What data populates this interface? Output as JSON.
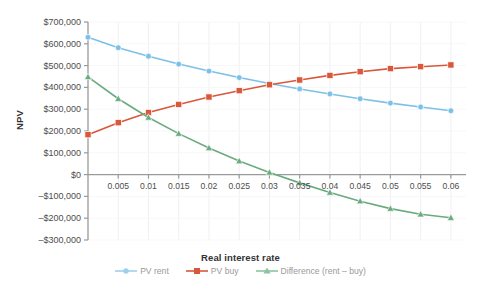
{
  "chart_data": {
    "type": "line",
    "title": "",
    "xlabel": "Real interest rate",
    "ylabel": "NPV",
    "x": [
      0,
      0.005,
      0.01,
      0.015,
      0.02,
      0.025,
      0.03,
      0.035,
      0.04,
      0.045,
      0.05,
      0.055,
      0.06
    ],
    "categories": [
      "0",
      "0.005",
      "0.01",
      "0.015",
      "0.02",
      "0.025",
      "0.03",
      "0.035",
      "0.04",
      "0.045",
      "0.05",
      "0.055",
      "0.06"
    ],
    "xtick_labels": [
      "0.005",
      "0.01",
      "0.015",
      "0.02",
      "0.025",
      "0.03",
      "0.035",
      "0.04",
      "0.045",
      "0.05",
      "0.055",
      "0.06"
    ],
    "ytick_labels": [
      "$700,000",
      "$600,000",
      "$500,000",
      "$400,000",
      "$300,000",
      "$200,000",
      "$100,000",
      "$0",
      "–$100,000",
      "–$200,000",
      "–$300,000"
    ],
    "ytick_values": [
      700000,
      600000,
      500000,
      400000,
      300000,
      200000,
      100000,
      0,
      -100000,
      -200000,
      -300000
    ],
    "ylim": [
      -300000,
      700000
    ],
    "xlim": [
      0,
      0.0625
    ],
    "grid": true,
    "legend_position": "bottom",
    "series": [
      {
        "name": "PV rent",
        "color": "#7cc0e8",
        "marker": "circle",
        "values": [
          630000,
          582000,
          543000,
          507000,
          475000,
          445000,
          418000,
          393000,
          370000,
          348000,
          328000,
          310000,
          293000
        ]
      },
      {
        "name": "PV buy",
        "color": "#d9573a",
        "marker": "square",
        "values": [
          183000,
          238000,
          285000,
          322000,
          356000,
          385000,
          412000,
          434000,
          455000,
          472000,
          486000,
          495000,
          503000
        ]
      },
      {
        "name": "Difference (rent – buy)",
        "color": "#69ab7f",
        "marker": "triangle",
        "values": [
          448000,
          348000,
          262000,
          188000,
          122000,
          62000,
          10000,
          -38000,
          -82000,
          -122000,
          -156000,
          -182000,
          -198000
        ]
      }
    ]
  },
  "legend": {
    "items": [
      {
        "label": "PV rent",
        "color": "#9ed0ee",
        "marker": "circle"
      },
      {
        "label": "PV buy",
        "color": "#d9573a",
        "marker": "square"
      },
      {
        "label": "Difference (rent – buy)",
        "color": "#8cc4a1",
        "marker": "triangle"
      }
    ]
  },
  "axes": {
    "x_title": "Real interest rate",
    "y_title": "NPV"
  }
}
